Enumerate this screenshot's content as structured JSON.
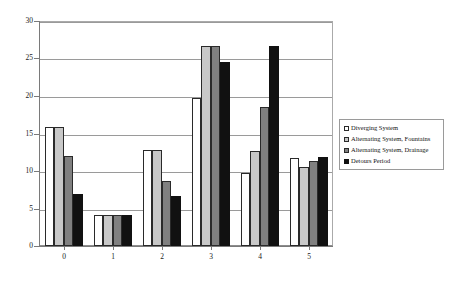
{
  "chart_data": {
    "type": "bar",
    "title": "",
    "subtitle": "",
    "xlabel": "",
    "ylabel": "",
    "categories": [
      "0",
      "1",
      "2",
      "3",
      "4",
      "5"
    ],
    "ylim": [
      0,
      30
    ],
    "yticks": [
      0,
      5,
      10,
      15,
      20,
      25,
      30
    ],
    "ytick_labels": [
      "0",
      "5",
      "10",
      "15",
      "20",
      "25",
      "30"
    ],
    "grid": true,
    "legend_position": "right",
    "orientation": "vertical",
    "grouping": "grouped",
    "series": [
      {
        "name": "Diverging System",
        "color": "#ffffff",
        "values": [
          15.9,
          4.1,
          12.8,
          19.8,
          9.8,
          11.7
        ]
      },
      {
        "name": "Alternating System, Fountains",
        "color": "#c8c8c8",
        "values": [
          15.9,
          4.1,
          12.8,
          26.7,
          12.7,
          10.6
        ]
      },
      {
        "name": "Alternating System, Drainage",
        "color": "#808080",
        "values": [
          12.0,
          4.1,
          8.7,
          26.7,
          18.6,
          11.3
        ]
      },
      {
        "name": "Detours Period",
        "color": "#111111",
        "values": [
          7.0,
          4.1,
          6.7,
          24.6,
          26.7,
          11.9
        ]
      }
    ]
  }
}
